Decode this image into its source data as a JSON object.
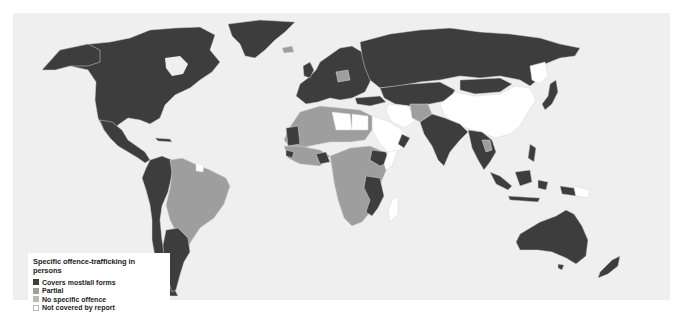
{
  "map": {
    "title": "Specific offence-trafficking in persons",
    "background": "#efefef",
    "ocean": "#efefef",
    "border_color": "#d8d8d8"
  },
  "legend": {
    "title": "Specific offence-trafficking in persons",
    "items": [
      {
        "label": "Covers most/all forms",
        "color": "#3d3d3d"
      },
      {
        "label": "Partial",
        "color": "#9e9e9e"
      },
      {
        "label": "No specific offence",
        "color": "#b9b9b9"
      },
      {
        "label": "Not covered by report",
        "color": "#ffffff"
      }
    ]
  },
  "regions": [
    {
      "name": "North America",
      "category": "Covers most/all forms"
    },
    {
      "name": "Greenland",
      "category": "Covers most/all forms"
    },
    {
      "name": "Mexico & Central America",
      "category": "Covers most/all forms"
    },
    {
      "name": "Brazil",
      "category": "Partial"
    },
    {
      "name": "Andean South America",
      "category": "Covers most/all forms"
    },
    {
      "name": "Argentina",
      "category": "Covers most/all forms"
    },
    {
      "name": "Europe",
      "category": "Covers most/all forms"
    },
    {
      "name": "Poland",
      "category": "Partial"
    },
    {
      "name": "Russia",
      "category": "Covers most/all forms"
    },
    {
      "name": "Central Asia",
      "category": "Covers most/all forms"
    },
    {
      "name": "China",
      "category": "Not covered by report"
    },
    {
      "name": "Mongolia",
      "category": "Covers most/all forms"
    },
    {
      "name": "Japan",
      "category": "Covers most/all forms"
    },
    {
      "name": "India",
      "category": "Covers most/all forms"
    },
    {
      "name": "Southeast Asia",
      "category": "Covers most/all forms"
    },
    {
      "name": "Indonesia",
      "category": "Covers most/all forms"
    },
    {
      "name": "Australia",
      "category": "Covers most/all forms"
    },
    {
      "name": "New Zealand",
      "category": "Covers most/all forms"
    },
    {
      "name": "North Africa",
      "category": "Partial"
    },
    {
      "name": "Libya",
      "category": "Not covered by report"
    },
    {
      "name": "Sub-Saharan Africa",
      "category": "Partial"
    },
    {
      "name": "Ethiopia",
      "category": "Covers most/all forms"
    },
    {
      "name": "Tanzania / Mozambique",
      "category": "Covers most/all forms"
    },
    {
      "name": "Arabian Peninsula",
      "category": "Not covered by report"
    },
    {
      "name": "Iran",
      "category": "Not covered by report"
    },
    {
      "name": "Afghanistan",
      "category": "Partial"
    },
    {
      "name": "Madagascar",
      "category": "Not covered by report"
    }
  ]
}
